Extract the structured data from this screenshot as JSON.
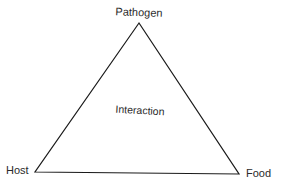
{
  "diagram": {
    "type": "triangle",
    "line_color": "#1a1a1a",
    "background": "#ffffff",
    "vertices": [
      {
        "id": "pathogen",
        "label": "Pathogen",
        "position": "top"
      },
      {
        "id": "host",
        "label": "Host",
        "position": "bottom-left"
      },
      {
        "id": "food",
        "label": "Food",
        "position": "bottom-right"
      }
    ],
    "center_label": "Interaction"
  }
}
